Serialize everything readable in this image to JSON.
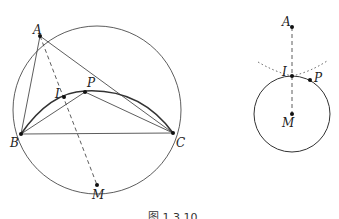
{
  "figure": {
    "caption": "图 1.3.10",
    "left": {
      "labels": {
        "A": "A",
        "B": "B",
        "C": "C",
        "P": "P",
        "I": "I",
        "M": "M"
      },
      "points": {
        "A": [
          40,
          36
        ],
        "B": [
          21,
          134
        ],
        "C": [
          173,
          133
        ],
        "P": [
          85,
          92
        ],
        "I": [
          64,
          97
        ],
        "M": [
          97,
          185
        ]
      },
      "circumcircle": {
        "cx": 97,
        "cy": 110,
        "r": 84
      }
    },
    "right": {
      "labels": {
        "A": "A",
        "I": "I",
        "P": "P",
        "M": "M"
      },
      "points": {
        "A": [
          292,
          27
        ],
        "I": [
          292,
          76
        ],
        "P": [
          310,
          80
        ],
        "M": [
          292,
          114
        ]
      },
      "circle": {
        "cx": 292,
        "cy": 114,
        "r": 38
      }
    }
  }
}
